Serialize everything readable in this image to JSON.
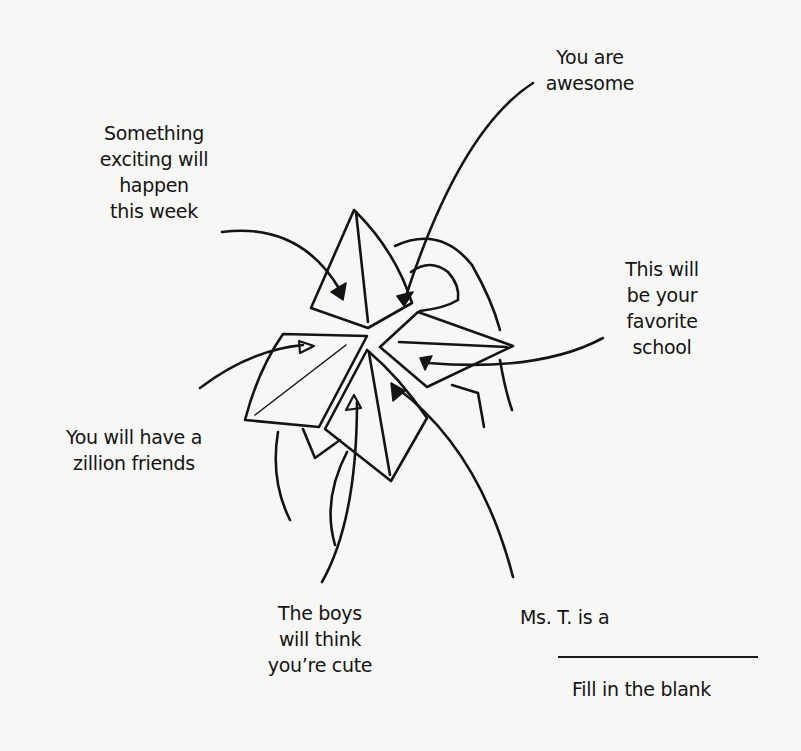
{
  "illustration": {
    "subject": "paper fortune teller with fortunes pointing to its flaps",
    "line_color": "#141414",
    "background_color": "#f7f7f5"
  },
  "labels": {
    "something_exciting": {
      "lines": [
        "Something",
        "exciting will",
        "happen",
        "this week"
      ]
    },
    "you_are_awesome": {
      "lines": [
        "You are",
        "awesome"
      ]
    },
    "favorite_school": {
      "lines": [
        "This will",
        "be your",
        "favorite",
        "school"
      ]
    },
    "zillion_friends": {
      "lines": [
        "You will have a",
        "zillion friends"
      ]
    },
    "boys_cute": {
      "lines": [
        "The boys",
        "will think",
        "you’re cute"
      ]
    },
    "ms_t": {
      "prompt": "Ms. T. is a",
      "caption": "Fill in the blank"
    }
  }
}
